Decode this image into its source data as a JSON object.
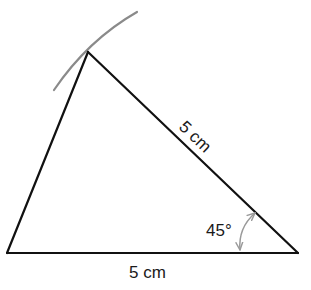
{
  "diagram": {
    "type": "triangle-construction",
    "labels": {
      "side_hypotenuse": "5 cm",
      "side_base": "5 cm",
      "angle": "45°"
    },
    "vertices": {
      "bottom_left": [
        7,
        253
      ],
      "bottom_right": [
        298,
        253
      ],
      "apex": [
        88,
        52
      ]
    },
    "colors": {
      "lines": "#111111",
      "construction_arc": "#8a8a8a",
      "angle_marker": "#9a9a9a",
      "text": "#1a1a1a"
    }
  }
}
